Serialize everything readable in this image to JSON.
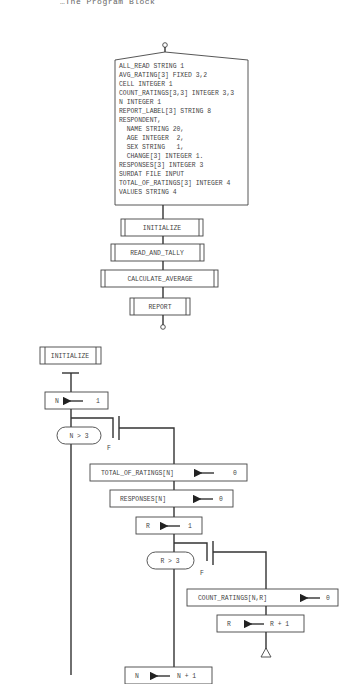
{
  "header": {
    "text": "…The Program Block"
  },
  "main_block": {
    "declarations": [
      "ALL_READ STRING 1",
      "AVG_RATING[3] FIXED 3,2",
      "CELL INTEGER 1",
      "COUNT_RATINGS[3,3] INTEGER 3,3",
      "N INTEGER 1",
      "REPORT_LABEL[3] STRING 8",
      "RESPONDENT,",
      "  NAME STRING 20,",
      "  AGE INTEGER  2,",
      "  SEX STRING   1,",
      "  CHANGE[3] INTEGER 1.",
      "RESPONSES[3] INTEGER 3",
      "SURDAT FILE INPUT",
      "TOTAL_OF_RATINGS[3] INTEGER 4",
      "VALUES STRING 4"
    ],
    "modules": [
      "INITIALIZE",
      "READ_AND_TALLY",
      "CALCULATE_AVERAGE",
      "REPORT"
    ]
  },
  "initialize_block": {
    "title": "INITIALIZE",
    "n_init": {
      "lhs": "N",
      "rhs": "1"
    },
    "outer_loop": {
      "condition": "N > 3",
      "false_label": "F"
    },
    "total_init": {
      "lhs": "TOTAL_OF_RATINGS[N]",
      "rhs": "0"
    },
    "responses_init": {
      "lhs": "RESPONSES[N]",
      "rhs": "0"
    },
    "r_init": {
      "lhs": "R",
      "rhs": "1"
    },
    "inner_loop": {
      "condition": "R > 3",
      "false_label": "F"
    },
    "count_init": {
      "lhs": "COUNT_RATINGS[N,R]",
      "rhs": "0"
    },
    "r_incr": {
      "lhs": "R",
      "rhs": "R + 1"
    },
    "n_incr": {
      "lhs": "N",
      "rhs": "N + 1"
    }
  }
}
